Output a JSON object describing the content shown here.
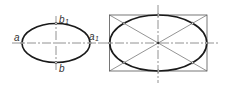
{
  "figure_left": {
    "title": "ellipse with conjugate axes points",
    "labels": {
      "a": "a",
      "a1": "a",
      "a1_sub": "1",
      "b": "b",
      "b1": "b",
      "b1_sub": "1"
    }
  },
  "figure_right": {
    "title": "ellipse inscribed in rectangle with diagonals"
  },
  "colors": {
    "stroke": "#1a1a1a",
    "axis": "#777777",
    "thin": "#666666"
  }
}
